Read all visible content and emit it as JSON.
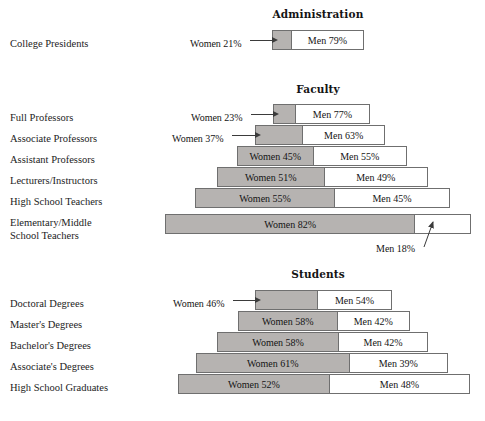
{
  "chart_data": {
    "type": "bar",
    "subtype": "centered-stacked-pyramid",
    "title": "",
    "xlabel": "",
    "ylabel": "",
    "grid": false,
    "legend": null,
    "axis_units": "percent",
    "xlim": [
      0,
      100
    ],
    "series": [
      {
        "name": "Women",
        "color": "#b6b3b1"
      },
      {
        "name": "Men",
        "color": "#ffffff"
      }
    ],
    "sections": [
      {
        "id": "administration",
        "heading": "Administration",
        "heading_center_x": 318,
        "heading_y": 8,
        "rows": [
          {
            "label": "College Presidents",
            "label_y": 38,
            "bar_y": 30,
            "bar_left": 272,
            "bar_width": 92,
            "women_pct": 21,
            "men_pct": 79,
            "women_label": "Women 21%",
            "men_label": "Men 79%",
            "women_label_outside": true,
            "women_label_x": 190,
            "women_label_y": 38,
            "leader_x": 250,
            "leader_w": 22,
            "men_label_outside": false
          }
        ]
      },
      {
        "id": "faculty",
        "heading": "Faculty",
        "heading_center_x": 318,
        "heading_y": 83,
        "rows": [
          {
            "label": "Full Professors",
            "label_y": 112,
            "bar_y": 104,
            "bar_left": 273,
            "bar_width": 97,
            "women_pct": 23,
            "men_pct": 77,
            "women_label": "Women 23%",
            "men_label": "Men 77%",
            "women_label_outside": true,
            "women_label_x": 191,
            "women_label_y": 112,
            "leader_x": 251,
            "leader_w": 22,
            "men_label_outside": false
          },
          {
            "label": "Associate Professors",
            "label_y": 133,
            "bar_y": 125,
            "bar_left": 255,
            "bar_width": 130,
            "women_pct": 37,
            "men_pct": 63,
            "women_label": "Women 37%",
            "men_label": "Men 63%",
            "women_label_outside": true,
            "women_label_x": 172,
            "women_label_y": 133,
            "leader_x": 232,
            "leader_w": 23,
            "men_label_outside": false
          },
          {
            "label": "Assistant Professors",
            "label_y": 154,
            "bar_y": 146,
            "bar_left": 237,
            "bar_width": 170,
            "women_pct": 45,
            "men_pct": 55,
            "women_label": "Women 45%",
            "men_label": "Men 55%",
            "women_label_outside": false,
            "men_label_outside": false
          },
          {
            "label": "Lecturers/Instructors",
            "label_y": 175,
            "bar_y": 167,
            "bar_left": 217,
            "bar_width": 211,
            "women_pct": 51,
            "men_pct": 49,
            "women_label": "Women 51%",
            "men_label": "Men 49%",
            "women_label_outside": false,
            "men_label_outside": false
          },
          {
            "label": "High School Teachers",
            "label_y": 196,
            "bar_y": 188,
            "bar_left": 195,
            "bar_width": 255,
            "women_pct": 55,
            "men_pct": 45,
            "women_label": "Women 55%",
            "men_label": "Men 45%",
            "women_label_outside": false,
            "men_label_outside": false
          },
          {
            "label": "Elementary/Middle\nSchool Teachers",
            "label_y": 217,
            "bar_y": 214,
            "bar_left": 165,
            "bar_width": 306,
            "women_pct": 82,
            "men_pct": 18,
            "women_label": "Women 82%",
            "men_label": "Men 18%",
            "women_label_outside": false,
            "men_label_outside": true,
            "men_label_x": 376,
            "men_label_y": 243
          }
        ]
      },
      {
        "id": "students",
        "heading": "Students",
        "heading_center_x": 318,
        "heading_y": 268,
        "rows": [
          {
            "label": "Doctoral Degrees",
            "label_y": 298,
            "bar_y": 290,
            "bar_left": 255,
            "bar_width": 137,
            "women_pct": 46,
            "men_pct": 54,
            "women_label": "Women 46%",
            "men_label": "Men 54%",
            "women_label_outside": true,
            "women_label_x": 173,
            "women_label_y": 298,
            "leader_x": 233,
            "leader_w": 22,
            "men_label_outside": false
          },
          {
            "label": "Master's Degrees",
            "label_y": 319,
            "bar_y": 311,
            "bar_left": 238,
            "bar_width": 172,
            "women_pct": 58,
            "men_pct": 42,
            "women_label": "Women 58%",
            "men_label": "Men 42%",
            "women_label_outside": false,
            "men_label_outside": false
          },
          {
            "label": "Bachelor's Degrees",
            "label_y": 340,
            "bar_y": 332,
            "bar_left": 217,
            "bar_width": 211,
            "women_pct": 58,
            "men_pct": 42,
            "women_label": "Women 58%",
            "men_label": "Men 42%",
            "women_label_outside": false,
            "men_label_outside": false
          },
          {
            "label": "Associate's Degrees",
            "label_y": 361,
            "bar_y": 353,
            "bar_left": 196,
            "bar_width": 252,
            "women_pct": 61,
            "men_pct": 39,
            "women_label": "Women 61%",
            "men_label": "Men 39%",
            "women_label_outside": false,
            "men_label_outside": false
          },
          {
            "label": "High School Graduates",
            "label_y": 382,
            "bar_y": 374,
            "bar_left": 178,
            "bar_width": 292,
            "women_pct": 52,
            "men_pct": 48,
            "women_label": "Women 52%",
            "men_label": "Men 48%",
            "women_label_outside": false,
            "men_label_outside": false
          }
        ]
      }
    ],
    "categories": [
      "College Presidents",
      "Full Professors",
      "Associate Professors",
      "Assistant Professors",
      "Lecturers/Instructors",
      "High School Teachers",
      "Elementary/Middle School Teachers",
      "Doctoral Degrees",
      "Master's Degrees",
      "Bachelor's Degrees",
      "Associate's Degrees",
      "High School Graduates"
    ],
    "values_women": [
      21,
      23,
      37,
      45,
      51,
      55,
      82,
      46,
      58,
      58,
      61,
      52
    ],
    "values_men": [
      79,
      77,
      63,
      55,
      49,
      45,
      18,
      54,
      42,
      42,
      39,
      48
    ]
  },
  "colors": {
    "women_fill": "#b6b3b1",
    "men_fill": "#ffffff",
    "bar_stroke": "#6f6f6f",
    "text": "#1a1a1a",
    "leader": "#3b3b3b",
    "background": "#ffffff"
  }
}
